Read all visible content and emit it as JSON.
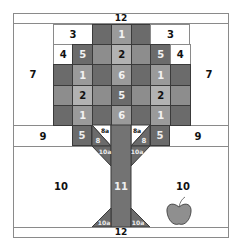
{
  "colors": {
    "dark": "#6b6b6b",
    "mid": "#8d8d8d",
    "mid_light": "#9a9a9a",
    "light": "#b2b2b2",
    "white": "#ffffff",
    "apple": "#8f8f8f",
    "border": "#8a8a8a"
  },
  "top_strip": {
    "label": "12"
  },
  "bottom_strip": {
    "label": "12"
  },
  "side_labels": {
    "left_upper": "7",
    "right_upper": "7",
    "left_row9": "9",
    "right_row9": "9",
    "left_lower": "10",
    "right_lower": "10"
  },
  "canopy": {
    "rows": [
      [
        {
          "label": "3",
          "shade": "white",
          "span": 2
        },
        {
          "label": "",
          "shade": "dark"
        },
        {
          "label": "1",
          "shade": "mid_light"
        },
        {
          "label": "",
          "shade": "dark"
        },
        {
          "label": "3",
          "shade": "white",
          "span": 2
        }
      ],
      [
        {
          "label": "4",
          "shade": "white"
        },
        {
          "label": "5",
          "shade": "dark"
        },
        {
          "label": "",
          "shade": "mid"
        },
        {
          "label": "2",
          "shade": "light"
        },
        {
          "label": "",
          "shade": "mid"
        },
        {
          "label": "5",
          "shade": "dark"
        },
        {
          "label": "4",
          "shade": "white"
        }
      ],
      [
        {
          "label": "",
          "shade": "dark"
        },
        {
          "label": "1",
          "shade": "mid_light"
        },
        {
          "label": "",
          "shade": "dark"
        },
        {
          "label": "6",
          "shade": "mid_light"
        },
        {
          "label": "",
          "shade": "dark"
        },
        {
          "label": "1",
          "shade": "mid_light"
        },
        {
          "label": "",
          "shade": "dark"
        }
      ],
      [
        {
          "label": "",
          "shade": "mid"
        },
        {
          "label": "2",
          "shade": "light"
        },
        {
          "label": "",
          "shade": "mid"
        },
        {
          "label": "5",
          "shade": "dark"
        },
        {
          "label": "",
          "shade": "mid"
        },
        {
          "label": "2",
          "shade": "light"
        },
        {
          "label": "",
          "shade": "mid"
        }
      ],
      [
        {
          "label": "",
          "shade": "dark"
        },
        {
          "label": "1",
          "shade": "mid_light"
        },
        {
          "label": "",
          "shade": "dark"
        },
        {
          "label": "6",
          "shade": "mid_light"
        },
        {
          "label": "",
          "shade": "dark"
        },
        {
          "label": "1",
          "shade": "mid_light"
        },
        {
          "label": "",
          "shade": "dark"
        }
      ]
    ]
  },
  "branch_row": {
    "left_block": "5",
    "right_block": "5",
    "left_branch_dark": "8",
    "left_branch_white": "8a",
    "right_branch_dark": "8",
    "right_branch_white": "8a",
    "left_flare_top": "10a",
    "right_flare_top": "10a"
  },
  "trunk": {
    "label": "11"
  },
  "roots": {
    "left": "10a",
    "right": "10a"
  },
  "apple": {
    "description": "apple-icon"
  }
}
